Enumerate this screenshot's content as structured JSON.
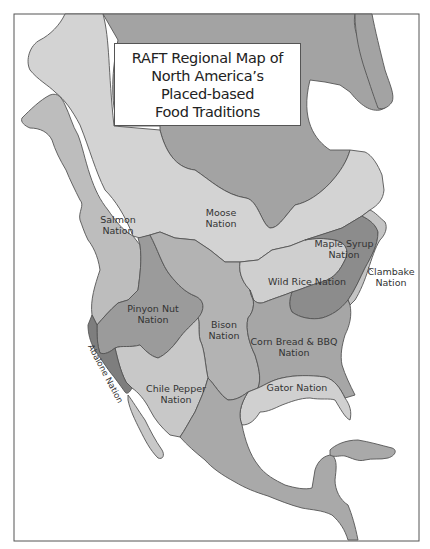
{
  "title": {
    "lines": [
      "RAFT Regional Map of",
      "North America’s",
      "Placed-based",
      "Food Traditions"
    ]
  },
  "colors": {
    "background": "#ffffff",
    "frame": "#555555",
    "arctic_dark": "#a3a3a3",
    "moose_light": "#d3d3d3",
    "salmon": "#bdbdbd",
    "pinyon": "#9b9b9b",
    "bison": "#b3b3b3",
    "maple": "#8c8c8c",
    "wild_rice": "#cfcfcf",
    "cornbread": "#a6a6a6",
    "chile": "#c8c8c8",
    "gator": "#d0d0d0",
    "abalone": "#7e7e7e",
    "clambake": "#c4c4c4",
    "mexico": "#a9a9a9"
  },
  "regions": [
    {
      "id": "salmon",
      "label_lines": [
        "Salmon",
        "Nation"
      ]
    },
    {
      "id": "moose",
      "label_lines": [
        "Moose",
        "Nation"
      ]
    },
    {
      "id": "maple-syrup",
      "label_lines": [
        "Maple Syrup",
        "Nation"
      ]
    },
    {
      "id": "clambake",
      "label_lines": [
        "Clambake",
        "Nation"
      ]
    },
    {
      "id": "wild-rice",
      "label_lines": [
        "Wild Rice Nation"
      ]
    },
    {
      "id": "pinyon-nut",
      "label_lines": [
        "Pinyon Nut",
        "Nation"
      ]
    },
    {
      "id": "bison",
      "label_lines": [
        "Bison",
        "Nation"
      ]
    },
    {
      "id": "abalone",
      "label_lines": [
        "Abalone Nation"
      ]
    },
    {
      "id": "corn-bread-bbq",
      "label_lines": [
        "Corn Bread & BBQ",
        "Nation"
      ]
    },
    {
      "id": "chile-pepper",
      "label_lines": [
        "Chile Pepper",
        "Nation"
      ]
    },
    {
      "id": "gator",
      "label_lines": [
        "Gator Nation"
      ]
    }
  ]
}
